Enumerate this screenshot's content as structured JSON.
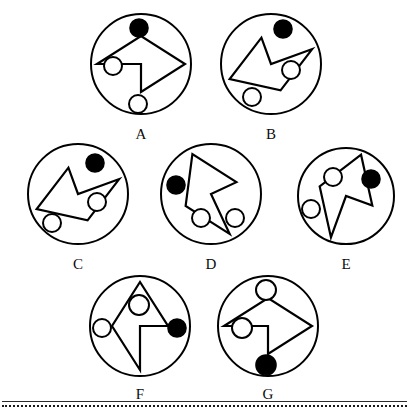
{
  "sheet": {
    "background_color": "#ffffff",
    "stroke_color": "#000000",
    "fill_black": "#000000",
    "fill_white": "#ffffff",
    "label_color": "#0b0b0b",
    "figure_count": 7
  },
  "footer": {
    "solid_rule_color": "#2a2a2a",
    "dotted_rule_color": "#1a1a1a"
  },
  "figures": [
    {
      "id": "A",
      "label": "A",
      "left": 85,
      "top": 12,
      "size": 112,
      "circle": {
        "cx": 56,
        "cy": 52,
        "r": 50
      },
      "dart": "M 8,54 L 52,26 L 96,54 L 52,82 L 52,54 Z",
      "dart_rotation": 0,
      "dots": [
        {
          "name": "top-black-dot",
          "cx": 54,
          "cy": 16,
          "r": 9,
          "fill": "black"
        },
        {
          "name": "left-white-dot",
          "cx": 28,
          "cy": 54,
          "r": 9,
          "fill": "white"
        },
        {
          "name": "bottom-white-dot",
          "cx": 53,
          "cy": 92,
          "r": 9,
          "fill": "white"
        }
      ]
    },
    {
      "id": "B",
      "label": "B",
      "left": 215,
      "top": 12,
      "size": 112,
      "circle": {
        "cx": 56,
        "cy": 52,
        "r": 50
      },
      "dart": "M 8,54 L 52,26 L 96,54 L 52,82 L 52,54 Z",
      "dart_rotation": 160,
      "dots": [
        {
          "name": "top-black-dot",
          "cx": 68,
          "cy": 17,
          "r": 9,
          "fill": "black"
        },
        {
          "name": "right-white-dot",
          "cx": 76,
          "cy": 58,
          "r": 9,
          "fill": "white"
        },
        {
          "name": "bottom-white-dot",
          "cx": 37,
          "cy": 85,
          "r": 9,
          "fill": "white"
        }
      ]
    },
    {
      "id": "C",
      "label": "C",
      "left": 22,
      "top": 142,
      "size": 112,
      "circle": {
        "cx": 56,
        "cy": 52,
        "r": 50
      },
      "dart": "M 8,54 L 52,26 L 96,54 L 52,82 L 52,54 Z",
      "dart_rotation": 160,
      "dots": [
        {
          "name": "top-black-dot",
          "cx": 73,
          "cy": 21,
          "r": 9,
          "fill": "black"
        },
        {
          "name": "right-white-dot",
          "cx": 75,
          "cy": 60,
          "r": 9,
          "fill": "white"
        },
        {
          "name": "bottom-white-dot",
          "cx": 30,
          "cy": 81,
          "r": 9,
          "fill": "white"
        }
      ]
    },
    {
      "id": "D",
      "label": "D",
      "left": 155,
      "top": 142,
      "size": 112,
      "circle": {
        "cx": 56,
        "cy": 52,
        "r": 50
      },
      "dart": "M 8,54 L 52,26 L 96,54 L 52,82 L 52,54 Z",
      "dart_rotation": 245,
      "dots": [
        {
          "name": "left-black-dot",
          "cx": 21,
          "cy": 43,
          "r": 9,
          "fill": "black"
        },
        {
          "name": "inner-white-dot",
          "cx": 46,
          "cy": 76,
          "r": 9,
          "fill": "white"
        },
        {
          "name": "right-white-dot",
          "cx": 80,
          "cy": 76,
          "r": 9,
          "fill": "white"
        }
      ]
    },
    {
      "id": "E",
      "label": "E",
      "left": 292,
      "top": 146,
      "size": 108,
      "circle": {
        "cx": 54,
        "cy": 50,
        "r": 48
      },
      "dart": "M 8,54 L 52,26 L 96,54 L 52,82 L 52,54 Z",
      "dart_rotation": 290,
      "dots": [
        {
          "name": "right-black-dot",
          "cx": 79,
          "cy": 33,
          "r": 9,
          "fill": "black"
        },
        {
          "name": "inner-white-dot",
          "cx": 41,
          "cy": 31,
          "r": 9,
          "fill": "white"
        },
        {
          "name": "left-white-dot",
          "cx": 19,
          "cy": 63,
          "r": 9,
          "fill": "white"
        }
      ]
    },
    {
      "id": "F",
      "label": "F",
      "left": 84,
      "top": 272,
      "size": 112,
      "circle": {
        "cx": 56,
        "cy": 54,
        "r": 50
      },
      "dart": "M 8,54 L 52,26 L 96,54 L 52,82 L 52,54 Z",
      "dart_rotation": 270,
      "dots": [
        {
          "name": "inner-white-dot",
          "cx": 55,
          "cy": 33,
          "r": 10,
          "fill": "white"
        },
        {
          "name": "left-white-dot",
          "cx": 18,
          "cy": 56,
          "r": 9,
          "fill": "white"
        },
        {
          "name": "right-black-dot",
          "cx": 93,
          "cy": 56,
          "r": 9,
          "fill": "black"
        }
      ]
    },
    {
      "id": "G",
      "label": "G",
      "left": 212,
      "top": 272,
      "size": 112,
      "circle": {
        "cx": 56,
        "cy": 54,
        "r": 50
      },
      "dart": "M 8,54 L 52,26 L 96,54 L 52,82 L 52,54 Z",
      "dart_rotation": 0,
      "dots": [
        {
          "name": "top-white-dot",
          "cx": 54,
          "cy": 18,
          "r": 10,
          "fill": "white"
        },
        {
          "name": "left-white-dot",
          "cx": 30,
          "cy": 56,
          "r": 10,
          "fill": "white"
        },
        {
          "name": "bottom-black-dot",
          "cx": 54,
          "cy": 93,
          "r": 10,
          "fill": "black"
        }
      ]
    }
  ]
}
